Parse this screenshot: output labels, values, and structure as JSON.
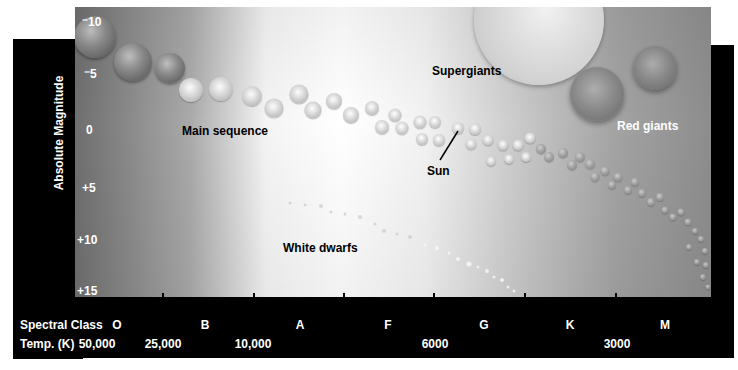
{
  "diagram": {
    "type": "Hertzsprung-Russell diagram",
    "y_axis": {
      "label": "Absolute Magnitude",
      "ticks": [
        {
          "label": "⁻10",
          "y": 22
        },
        {
          "label": "⁻5",
          "y": 74
        },
        {
          "label": "0",
          "y": 130
        },
        {
          "label": "+5",
          "y": 188
        },
        {
          "label": "+10",
          "y": 240
        },
        {
          "label": "+15",
          "y": 291
        }
      ]
    },
    "x_axis": {
      "spectral_class_label": "Spectral Class",
      "temperature_label": "Temp. (K)",
      "spectral_classes": [
        {
          "label": "O",
          "x": 117
        },
        {
          "label": "B",
          "x": 205
        },
        {
          "label": "A",
          "x": 300
        },
        {
          "label": "F",
          "x": 388
        },
        {
          "label": "G",
          "x": 484
        },
        {
          "label": "K",
          "x": 570
        },
        {
          "label": "M",
          "x": 665
        }
      ],
      "temperatures": [
        {
          "label": "50,000",
          "x": 95
        },
        {
          "label": "25,000",
          "x": 163
        },
        {
          "label": "10,000",
          "x": 253
        },
        {
          "label": "6000",
          "x": 435
        },
        {
          "label": "3000",
          "x": 617
        }
      ],
      "tick_positions": [
        163,
        254,
        344,
        434,
        525,
        616
      ]
    },
    "annotations": {
      "main_sequence": "Main sequence",
      "supergiants": "Supergiants",
      "red_giants": "Red giants",
      "sun": "Sun",
      "white_dwarfs": "White dwarfs"
    },
    "colors": {
      "frame": "#000000",
      "label_text": "#ffffff",
      "annotation_text": "#000000"
    }
  }
}
